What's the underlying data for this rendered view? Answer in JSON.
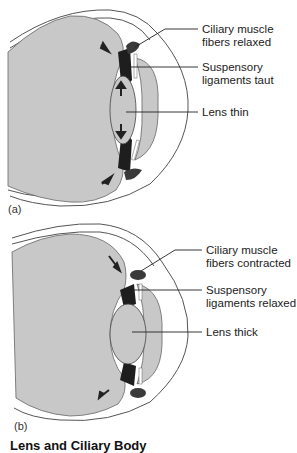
{
  "panels": [
    {
      "tag": "(a)",
      "labels": {
        "ciliary": [
          "Ciliary muscle",
          "fibers relaxed"
        ],
        "suspensory": [
          "Suspensory",
          "ligaments taut"
        ],
        "lens": [
          "Lens thin"
        ]
      }
    },
    {
      "tag": "(b)",
      "labels": {
        "ciliary": [
          "Ciliary muscle",
          "fibers contracted"
        ],
        "suspensory": [
          "Suspensory",
          "ligaments relaxed"
        ],
        "lens": [
          "Lens thick"
        ]
      }
    }
  ],
  "caption": "Lens and Ciliary Body",
  "colors": {
    "eyeball_fill": "#c8c8c8",
    "outline": "#555555",
    "dark_structure": "#3a3a3a",
    "ligament": "#1e1e1e"
  }
}
